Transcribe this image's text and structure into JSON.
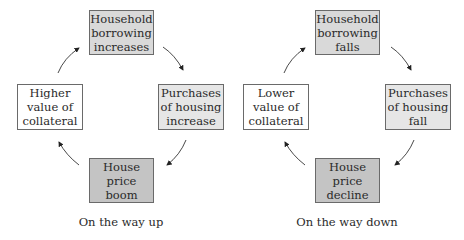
{
  "diagrams": [
    {
      "caption": "On the way up",
      "top": "Household borrowing increases",
      "right": "Purchases of housing increase",
      "bottom": "House price boom",
      "left": "Higher value of collateral"
    },
    {
      "caption": "On the way down",
      "top": "Household borrowing falls",
      "right": "Purchases of housing fall",
      "bottom": "House price decline",
      "left": "Lower value of collateral"
    }
  ],
  "colors": {
    "top_box": "#d9d9d9",
    "right_box": "#e6e6e6",
    "bottom_box": "#c4c4c4",
    "left_box": "#ffffff",
    "border": "#6a6a6a"
  }
}
